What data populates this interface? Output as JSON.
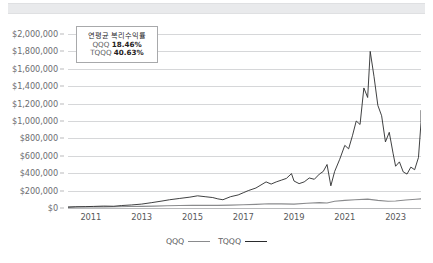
{
  "top_band": {
    "name": "toolbar-band"
  },
  "annotation": {
    "title": "연평균 복리수익률",
    "rows": [
      {
        "ticker": "QQQ",
        "value": "18.46%"
      },
      {
        "ticker": "TQQQ",
        "value": "40.63%"
      }
    ]
  },
  "legend": {
    "items": [
      {
        "label": "QQQ",
        "color": "#8a8b8d"
      },
      {
        "label": "TQQQ",
        "color": "#2a2b2d"
      }
    ]
  },
  "chart_data": {
    "type": "line",
    "title": "",
    "subtitle": "",
    "xlabel": "",
    "ylabel": "",
    "grid": true,
    "legend_position": "bottom",
    "ylim": [
      0,
      2000000
    ],
    "ytick_labels": [
      "$0",
      "$200,000",
      "$400,000",
      "$600,000",
      "$800,000",
      "$1,000,000",
      "$1,200,000",
      "$1,400,000",
      "$1,600,000",
      "$1,800,000",
      "$2,000,000"
    ],
    "ytick_values": [
      0,
      200000,
      400000,
      600000,
      800000,
      1000000,
      1200000,
      1400000,
      1600000,
      1800000,
      2000000
    ],
    "xtick_labels": [
      "2011",
      "2013",
      "2015",
      "2017",
      "2019",
      "2021",
      "2023"
    ],
    "xtick_values": [
      2011,
      2013,
      2015,
      2017,
      2019,
      2021,
      2023
    ],
    "xlim": [
      2010.1,
      2024.0
    ],
    "series": [
      {
        "name": "QQQ",
        "color": "#8a8b8d",
        "x": [
          2010.1,
          2010.5,
          2011.0,
          2011.5,
          2012.0,
          2012.5,
          2013.0,
          2013.5,
          2014.0,
          2014.5,
          2015.0,
          2015.5,
          2016.0,
          2016.5,
          2017.0,
          2017.5,
          2018.0,
          2018.5,
          2019.0,
          2019.5,
          2020.0,
          2020.3,
          2020.6,
          2021.0,
          2021.4,
          2021.9,
          2022.3,
          2022.7,
          2023.0,
          2023.4,
          2023.8,
          2024.0
        ],
        "values": [
          10000,
          11500,
          12000,
          13000,
          15000,
          17000,
          19000,
          22000,
          25000,
          28000,
          30000,
          30500,
          30000,
          33000,
          37000,
          42000,
          48000,
          47000,
          45000,
          55000,
          62000,
          58000,
          78000,
          88000,
          95000,
          102000,
          88000,
          78000,
          80000,
          92000,
          100000,
          105000
        ]
      },
      {
        "name": "TQQQ",
        "color": "#2a2b2d",
        "x": [
          2010.1,
          2010.4,
          2010.8,
          2011.1,
          2011.5,
          2011.9,
          2012.2,
          2012.6,
          2013.0,
          2013.4,
          2013.8,
          2014.1,
          2014.5,
          2014.9,
          2015.2,
          2015.5,
          2015.8,
          2016.0,
          2016.2,
          2016.5,
          2016.8,
          2017.0,
          2017.2,
          2017.5,
          2017.7,
          2017.9,
          2018.1,
          2018.3,
          2018.5,
          2018.7,
          2018.9,
          2019.0,
          2019.2,
          2019.4,
          2019.6,
          2019.8,
          2020.0,
          2020.15,
          2020.3,
          2020.45,
          2020.6,
          2020.8,
          2021.0,
          2021.15,
          2021.3,
          2021.45,
          2021.6,
          2021.75,
          2021.9,
          2022.0,
          2022.15,
          2022.3,
          2022.45,
          2022.6,
          2022.75,
          2022.9,
          2023.0,
          2023.15,
          2023.3,
          2023.45,
          2023.6,
          2023.75,
          2023.9,
          2024.0
        ],
        "values": [
          10000,
          14000,
          16000,
          18000,
          22000,
          20000,
          28000,
          35000,
          45000,
          62000,
          80000,
          95000,
          110000,
          125000,
          140000,
          130000,
          120000,
          105000,
          95000,
          130000,
          150000,
          175000,
          200000,
          230000,
          265000,
          300000,
          275000,
          300000,
          320000,
          340000,
          395000,
          310000,
          280000,
          300000,
          345000,
          330000,
          390000,
          420000,
          500000,
          255000,
          420000,
          560000,
          720000,
          680000,
          830000,
          1000000,
          960000,
          1380000,
          1270000,
          1800000,
          1510000,
          1180000,
          1060000,
          760000,
          870000,
          630000,
          480000,
          530000,
          415000,
          390000,
          470000,
          440000,
          580000,
          980000
        ],
        "end_value": 1120000
      }
    ]
  }
}
